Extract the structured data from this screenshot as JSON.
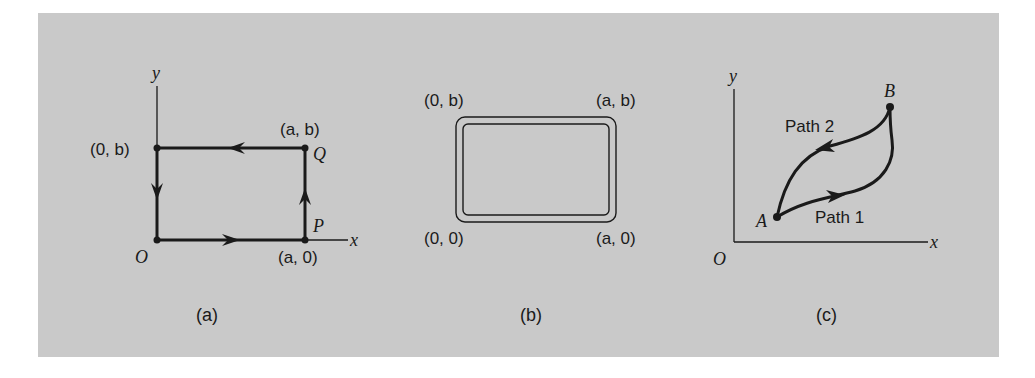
{
  "figure": {
    "background": "#c9c9c9",
    "stroke_color": "#1a1a1a",
    "panels": [
      {
        "id": "a",
        "caption": "(a)",
        "axis_labels": {
          "x": "x",
          "y": "y"
        },
        "origin_label": "O",
        "points": [
          {
            "name": "O",
            "coord": ""
          },
          {
            "name": "P",
            "coord": "(a, 0)"
          },
          {
            "name": "Q",
            "coord": "(a, b)"
          },
          {
            "name": "",
            "coord": "(0, b)"
          }
        ],
        "path_direction": "counterclockwise O → P → Q → (0,b) → O"
      },
      {
        "id": "b",
        "caption": "(b)",
        "corners": {
          "top_left": "(0, b)",
          "top_right": "(a, b)",
          "bottom_left": "(0, 0)",
          "bottom_right": "(a, 0)"
        },
        "shape": "double-line rounded rectangle"
      },
      {
        "id": "c",
        "caption": "(c)",
        "axis_labels": {
          "x": "x",
          "y": "y"
        },
        "origin_label": "O",
        "points": [
          {
            "name": "A"
          },
          {
            "name": "B"
          }
        ],
        "paths": [
          {
            "label": "Path 1",
            "direction": "A → B (lower curve)"
          },
          {
            "label": "Path 2",
            "direction": "B → A (upper curve)"
          }
        ]
      }
    ]
  }
}
